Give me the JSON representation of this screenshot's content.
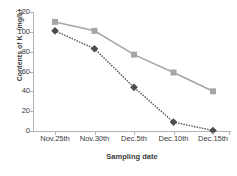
{
  "chart_data": {
    "type": "line",
    "title": "",
    "xlabel": "Sampling date",
    "ylabel": "Contents of K（mg/L）",
    "categories": [
      "Nov.25th",
      "Nov.30th",
      "Dec.5th",
      "Dec.10th",
      "Dec.15th"
    ],
    "ylim": [
      0,
      120
    ],
    "yticks": [
      0,
      20,
      40,
      60,
      80,
      100,
      120
    ],
    "ytick_labels": [
      "0",
      "20",
      "40",
      "60",
      "80",
      "100",
      "120"
    ],
    "grid": false,
    "legend": "none",
    "series": [
      {
        "name": "series-square-solid",
        "marker": "square",
        "line_style": "solid",
        "color": "#a6a6a6",
        "marker_color": "#a6a6a6",
        "values": [
          110,
          101,
          77,
          59,
          40
        ]
      },
      {
        "name": "series-diamond-dotted",
        "marker": "diamond",
        "line_style": "dotted",
        "color": "#595959",
        "marker_color": "#4d4d4d",
        "values": [
          101,
          83,
          44,
          9,
          0.5
        ]
      }
    ]
  },
  "axes": {
    "y_axis_title": "Contents of K（mg/L）",
    "x_axis_title": "Sampling date",
    "y_ticks": [
      {
        "label": "120",
        "value": 120
      },
      {
        "label": "100",
        "value": 100
      },
      {
        "label": "80",
        "value": 80
      },
      {
        "label": "60",
        "value": 60
      },
      {
        "label": "40",
        "value": 40
      },
      {
        "label": "20",
        "value": 20
      },
      {
        "label": "0",
        "value": 0
      }
    ],
    "x_ticks": [
      {
        "label": "Nov.25th"
      },
      {
        "label": "Nov.30th"
      },
      {
        "label": "Dec.5th"
      },
      {
        "label": "Dec.10th"
      },
      {
        "label": "Dec.15th"
      }
    ]
  },
  "colors": {
    "axis": "#b3b3b3",
    "text": "#3a3a3a",
    "series_light_gray": "#a6a6a6",
    "series_dark_gray": "#4d4d4d",
    "background": "#ffffff"
  }
}
